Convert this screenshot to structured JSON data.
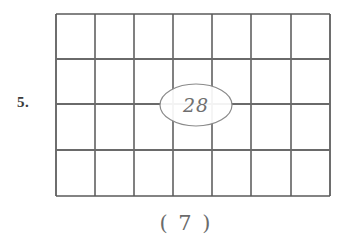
{
  "page": {
    "background_color": "#ffffff",
    "width": 345,
    "height": 242
  },
  "question": {
    "number_label": "5.",
    "answer_blank": "( 7 )"
  },
  "figure": {
    "type": "rectangular-grid",
    "columns": 7,
    "rows": 4,
    "total_cells": 28,
    "line_color": "#4a4a4a",
    "grid_bounds": {
      "left": 56,
      "top": 14,
      "right": 330,
      "bottom": 196
    },
    "column_x": [
      56,
      95,
      134,
      173,
      212,
      251,
      291,
      330
    ],
    "row_y": [
      14,
      59,
      104,
      150,
      196
    ],
    "callout": {
      "shape": "ellipse",
      "value": "28",
      "center_x": 196,
      "center_y": 105,
      "radius_x": 36,
      "radius_y": 21,
      "stroke_color": "#8a8a8a",
      "text_color": "#6f6f6f"
    }
  }
}
